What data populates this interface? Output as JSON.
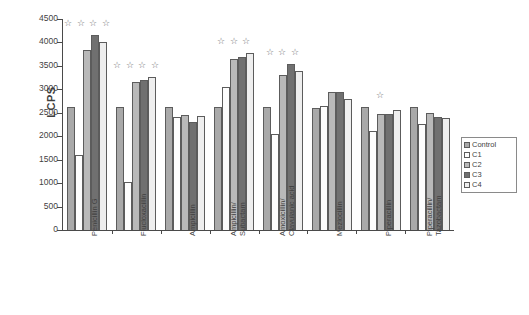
{
  "chart_data": {
    "type": "bar",
    "title": "",
    "xlabel": "",
    "ylabel": "LCPS",
    "ylim": [
      0,
      4500
    ],
    "yticks": [
      0,
      500,
      1000,
      1500,
      2000,
      2500,
      3000,
      3500,
      4000,
      4500
    ],
    "grid": false,
    "legend_position": "right",
    "categories": [
      "Penicillin G",
      "Flucloxacillin",
      "Ampicillin",
      "Ampicillin/ Subactam",
      "Amoxicillin/ Clavulanic acid",
      "Mezlocillin",
      "Piperacillin",
      "Piperacillin/ Tazobactam"
    ],
    "category_lines": [
      [
        "Penicillin G",
        ""
      ],
      [
        "Flucloxacillin",
        ""
      ],
      [
        "Ampicillin",
        ""
      ],
      [
        "Ampicillin/",
        "Subactam"
      ],
      [
        "Amoxicillin/",
        "Clavulanic acid"
      ],
      [
        "Mezlocillin",
        ""
      ],
      [
        "Piperacillin",
        ""
      ],
      [
        "Piperacillin/",
        "Tazobactam"
      ]
    ],
    "series": [
      {
        "name": "Control",
        "color": "#a9a9a9",
        "values": [
          2620,
          2620,
          2620,
          2620,
          2620,
          2610,
          2620,
          2620
        ]
      },
      {
        "name": "C1",
        "color": "#fdfdfd",
        "values": [
          1590,
          1020,
          2400,
          3060,
          2050,
          2650,
          2120,
          2260
        ]
      },
      {
        "name": "C2",
        "color": "#b9b9b9",
        "values": [
          3830,
          3160,
          2460,
          3640,
          3310,
          2950,
          2480,
          2500
        ]
      },
      {
        "name": "C3",
        "color": "#707070",
        "values": [
          4150,
          3190,
          2310,
          3690,
          3530,
          2940,
          2480,
          2420
        ]
      },
      {
        "name": "C4",
        "color": "#eeeeee",
        "values": [
          4000,
          3260,
          2440,
          3780,
          3400,
          2800,
          2550,
          2380
        ]
      }
    ],
    "significance_markers": {
      "symbol": "☆",
      "counts": [
        4,
        4,
        0,
        3,
        3,
        0,
        1,
        0
      ]
    }
  },
  "legend": {
    "items": [
      {
        "label": "Control",
        "swatch": "s-control"
      },
      {
        "label": "C1",
        "swatch": "s-c1"
      },
      {
        "label": "C2",
        "swatch": "s-c2"
      },
      {
        "label": "C3",
        "swatch": "s-c3"
      },
      {
        "label": "C4",
        "swatch": "s-c4"
      }
    ]
  }
}
